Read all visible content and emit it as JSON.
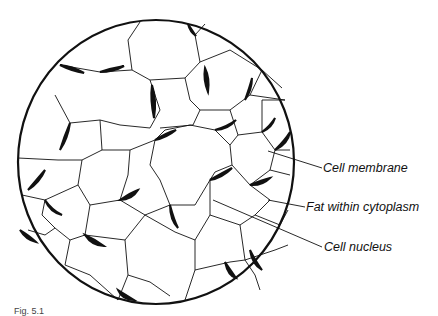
{
  "diagram": {
    "labels": [
      {
        "id": "cell-membrane",
        "text": "Cell membrane",
        "x": 323,
        "y": 160
      },
      {
        "id": "fat-within-cytoplasm",
        "text": "Fat within cytoplasm",
        "x": 306,
        "y": 199
      },
      {
        "id": "cell-nucleus",
        "text": "Cell nucleus",
        "x": 324,
        "y": 239
      }
    ],
    "caption": "Fig. 5.1"
  }
}
